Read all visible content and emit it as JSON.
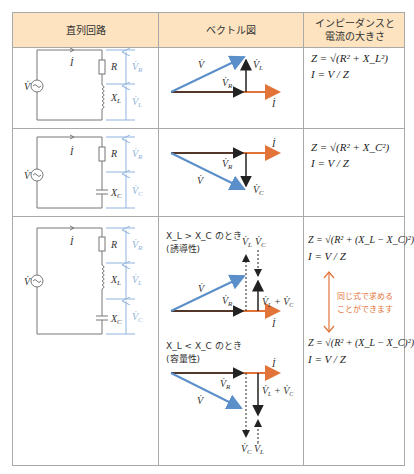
{
  "header": {
    "col1": "直列回路",
    "col2": "ベクトル図",
    "col3_line1": "インピーダンスと",
    "col3_line2": "電流の大きさ"
  },
  "colors": {
    "header_bg": "#fde3bf",
    "border": "#a9a9a9",
    "voltage_blue": "#5b8fc9",
    "current_orange": "#e2743a",
    "component_black": "#222222",
    "measure_lightblue": "#8fb3dc"
  },
  "rows": [
    {
      "circuit": {
        "source": "V",
        "current": "I",
        "components": [
          "R",
          "X_L"
        ],
        "voltages": [
          "V_R",
          "V_L"
        ]
      },
      "vector": {
        "labels": [
          "V",
          "V_R",
          "V_L",
          "I"
        ]
      },
      "formula": {
        "z": "Z = √(R² + X_L²)",
        "i": "I = V / Z"
      }
    },
    {
      "circuit": {
        "source": "V",
        "current": "I",
        "components": [
          "R",
          "X_C"
        ],
        "voltages": [
          "V_R",
          "V_C"
        ]
      },
      "vector": {
        "labels": [
          "V",
          "V_R",
          "V_C",
          "I"
        ]
      },
      "formula": {
        "z": "Z = √(R² + X_C²)",
        "i": "I = V / Z"
      }
    },
    {
      "circuit": {
        "source": "V",
        "current": "I",
        "components": [
          "R",
          "X_L",
          "X_C"
        ],
        "voltages": [
          "V_R",
          "V_L",
          "V_C"
        ]
      },
      "vector_inductive": {
        "condition": "X_L > X_C のとき",
        "type": "(誘導性)",
        "labels": [
          "V",
          "V_R",
          "V_L",
          "V_C",
          "V_L + V_C",
          "I"
        ]
      },
      "vector_capacitive": {
        "condition": "X_L < X_C のとき",
        "type": "(容量性)",
        "labels": [
          "V",
          "V_R",
          "V_L",
          "V_C",
          "V_L + V_C",
          "I"
        ]
      },
      "formula_top": {
        "z": "Z = √(R² + (X_L − X_C)²)",
        "i": "I = V / Z"
      },
      "formula_bottom": {
        "z": "Z = √(R² + (X_L − X_C)²)",
        "i": "I = V / Z"
      },
      "note_line1": "同じ式で求める",
      "note_line2": "ことができます"
    }
  ]
}
